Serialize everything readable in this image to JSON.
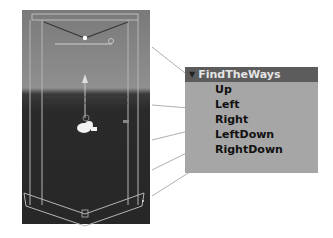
{
  "scene_view": {
    "sky_color": "#8a8a8a",
    "ground_color": "#272727",
    "gizmo_color": "#b0b0b0",
    "character_icon": "camera-icon"
  },
  "hierarchy_panel": {
    "header": {
      "expand_icon": "triangle-down-icon",
      "label": "FindTheWays",
      "color": "#5c5c5c"
    },
    "items": [
      {
        "label": "Up"
      },
      {
        "label": "Left"
      },
      {
        "label": "Right"
      },
      {
        "label": "LeftDown"
      },
      {
        "label": "RightDown"
      }
    ],
    "background": "#a6a6a6"
  }
}
